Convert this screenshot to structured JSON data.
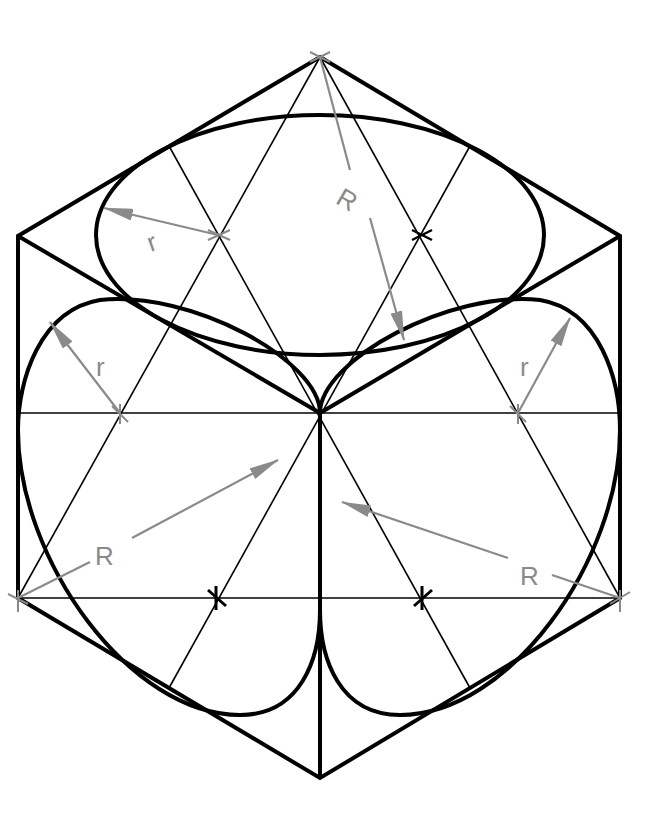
{
  "diagram": {
    "colors": {
      "outline": "#000000",
      "construction": "#000000",
      "dimension": "#8a8a8a",
      "background": "#ffffff"
    },
    "hexagon": {
      "top": [
        320,
        57
      ],
      "upper_left": [
        18,
        236
      ],
      "upper_right": [
        620,
        236
      ],
      "lower_left": [
        18,
        598
      ],
      "lower_right": [
        620,
        598
      ],
      "bottom": [
        320,
        778
      ],
      "center": [
        320,
        413
      ]
    },
    "labels": {
      "top_small_radius": "r",
      "top_large_radius": "R",
      "left_small_radius": "r",
      "right_small_radius": "r",
      "left_large_radius": "R",
      "right_large_radius": "R"
    },
    "arc_centers": [
      {
        "name": "top-face-left",
        "pos": [
          218,
          235
        ]
      },
      {
        "name": "top-face-right",
        "pos": [
          422,
          235
        ]
      },
      {
        "name": "left-face-upper",
        "pos": [
          120,
          413
        ]
      },
      {
        "name": "right-face-upper",
        "pos": [
          518,
          413
        ]
      },
      {
        "name": "left-face-lower",
        "pos": [
          216,
          598
        ]
      },
      {
        "name": "right-face-lower",
        "pos": [
          422,
          598
        ]
      }
    ]
  }
}
